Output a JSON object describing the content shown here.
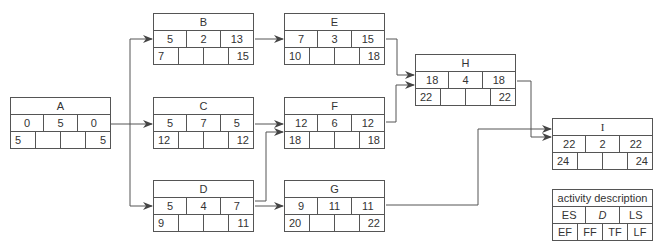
{
  "diagram": {
    "type": "activity-on-node network (critical path)",
    "nodes": [
      {
        "id": "A",
        "es": "0",
        "d": "5",
        "ls": "0",
        "ef": "5",
        "ff": "",
        "tf": "",
        "lf": "5"
      },
      {
        "id": "B",
        "es": "5",
        "d": "2",
        "ls": "13",
        "ef": "7",
        "ff": "",
        "tf": "",
        "lf": "15"
      },
      {
        "id": "C",
        "es": "5",
        "d": "7",
        "ls": "5",
        "ef": "12",
        "ff": "",
        "tf": "",
        "lf": "12"
      },
      {
        "id": "D",
        "es": "5",
        "d": "4",
        "ls": "7",
        "ef": "9",
        "ff": "",
        "tf": "",
        "lf": "11"
      },
      {
        "id": "E",
        "es": "7",
        "d": "3",
        "ls": "15",
        "ef": "10",
        "ff": "",
        "tf": "",
        "lf": "18"
      },
      {
        "id": "F",
        "es": "12",
        "d": "6",
        "ls": "12",
        "ef": "18",
        "ff": "",
        "tf": "",
        "lf": "18"
      },
      {
        "id": "G",
        "es": "9",
        "d": "11",
        "ls": "11",
        "ef": "20",
        "ff": "",
        "tf": "",
        "lf": "22"
      },
      {
        "id": "H",
        "es": "18",
        "d": "4",
        "ls": "18",
        "ef": "22",
        "ff": "",
        "tf": "",
        "lf": "22"
      },
      {
        "id": "I",
        "es": "22",
        "d": "2",
        "ls": "22",
        "ef": "24",
        "ff": "",
        "tf": "",
        "lf": "24"
      }
    ],
    "edges": [
      [
        "A",
        "B"
      ],
      [
        "A",
        "C"
      ],
      [
        "A",
        "D"
      ],
      [
        "B",
        "E"
      ],
      [
        "C",
        "F"
      ],
      [
        "D",
        "F"
      ],
      [
        "D",
        "G"
      ],
      [
        "E",
        "H"
      ],
      [
        "F",
        "H"
      ],
      [
        "H",
        "I"
      ],
      [
        "G",
        "I"
      ]
    ],
    "legend": {
      "title": "activity description",
      "row1": [
        "ES",
        "D",
        "LS"
      ],
      "row2": [
        "EF",
        "FF",
        "TF",
        "LF"
      ]
    }
  }
}
